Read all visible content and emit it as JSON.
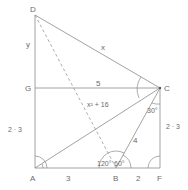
{
  "diagram": {
    "points": {
      "D": {
        "label": "D"
      },
      "G": {
        "label": "G"
      },
      "C": {
        "label": "C"
      },
      "A": {
        "label": "A"
      },
      "B": {
        "label": "B"
      },
      "F": {
        "label": "F"
      }
    },
    "segment_labels": {
      "DG": "y",
      "DC": "x",
      "GC": "5",
      "DB": "x² + 16",
      "BC": "4",
      "AG": "2 · 3",
      "CF": "2 · 3",
      "AB": "3",
      "BF": "2"
    },
    "angle_labels": {
      "BCF": "30°",
      "ABD": "120°",
      "CBF": "60°"
    },
    "colors": {
      "line": "#8a8a8a",
      "text": "#6a6a6a",
      "background": "#ffffff"
    }
  }
}
